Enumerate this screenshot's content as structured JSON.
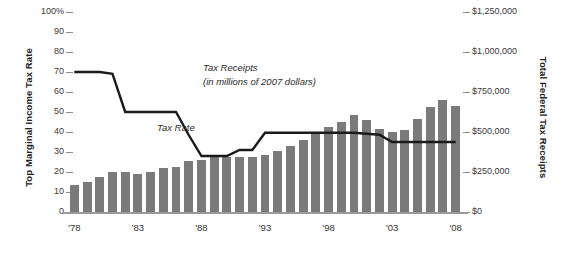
{
  "chart_data": {
    "type": "bar",
    "title": "",
    "subtitle": "",
    "xlabel": "",
    "ylabel": "Top Marginal Income Tax Rate",
    "y2label": "Total Federal Tax Receipts",
    "grid": false,
    "legend_position": "inline-annotations",
    "x": [
      1978,
      1979,
      1980,
      1981,
      1982,
      1983,
      1984,
      1985,
      1986,
      1987,
      1988,
      1989,
      1990,
      1991,
      1992,
      1993,
      1994,
      1995,
      1996,
      1997,
      1998,
      1999,
      2000,
      2001,
      2002,
      2003,
      2004,
      2005,
      2006,
      2007,
      2008
    ],
    "x_tick_labels": [
      "'78",
      "'83",
      "'88",
      "'93",
      "'98",
      "'03",
      "'08"
    ],
    "x_tick_values": [
      1978,
      1983,
      1988,
      1993,
      1998,
      2003,
      2008
    ],
    "ylim": [
      0,
      100
    ],
    "y_tick_labels": [
      "0",
      "10",
      "20",
      "30",
      "40",
      "50",
      "60",
      "70",
      "80",
      "90",
      "100%"
    ],
    "y_tick_values": [
      0,
      10,
      20,
      30,
      40,
      50,
      60,
      70,
      80,
      90,
      100
    ],
    "y2lim": [
      0,
      1250000
    ],
    "y2_tick_labels": [
      "$0",
      "$250,000",
      "$500,000",
      "$750,000",
      "$1,000,000",
      "$1,250,000"
    ],
    "y2_tick_values": [
      0,
      250000,
      500000,
      750000,
      1000000,
      1250000
    ],
    "series": [
      {
        "name": "Tax Receipts",
        "type": "bar",
        "axis": "right",
        "unit": "millions of 2007 dollars",
        "color": "#7a7a7a",
        "values": [
          170000,
          188000,
          216000,
          250000,
          248000,
          238000,
          253000,
          275000,
          283000,
          316000,
          325000,
          343000,
          345000,
          341000,
          342000,
          357000,
          383000,
          413000,
          447000,
          490000,
          532000,
          560000,
          605000,
          573000,
          520000,
          497000,
          512000,
          580000,
          655000,
          700000,
          660000
        ]
      },
      {
        "name": "Tax Rate",
        "type": "line",
        "axis": "left",
        "unit": "percent",
        "color": "#1a1a1a",
        "values": [
          70,
          70,
          70,
          69.125,
          50,
          50,
          50,
          50,
          50,
          38.5,
          28,
          28,
          28,
          31,
          31,
          39.6,
          39.6,
          39.6,
          39.6,
          39.6,
          39.6,
          39.6,
          39.6,
          39.1,
          38.6,
          35,
          35,
          35,
          35,
          35,
          35
        ]
      }
    ],
    "annotations": [
      {
        "name": "tax-receipts-label",
        "line1": "Tax Receipts",
        "line2": "(in millions of 2007 dollars)"
      },
      {
        "name": "tax-rate-label",
        "text": "Tax Rate"
      }
    ]
  },
  "colors": {
    "bar": "#7a7a7a",
    "line": "#1a1a1a",
    "axis": "#9a9a9a",
    "tick": "#8a8a8a",
    "text": "#2b2b2b",
    "background": "#ffffff"
  }
}
